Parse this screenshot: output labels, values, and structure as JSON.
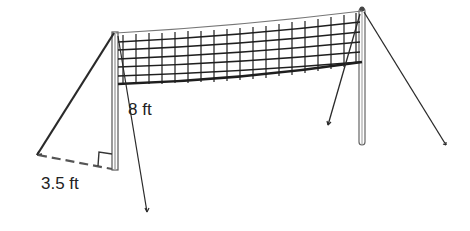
{
  "diagram": {
    "labels": {
      "height": "8 ft",
      "base": "3.5 ft"
    },
    "colors": {
      "line": "#2a2a2a",
      "pole": "#9a9a9a",
      "net": "#1e1e1e",
      "dashed": "#555555"
    },
    "annotations": {
      "right_angle_marker": true,
      "dashed_ground_segment": true
    }
  }
}
